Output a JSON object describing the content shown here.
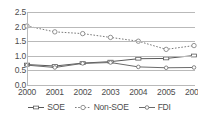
{
  "chart_data": {
    "type": "line",
    "title": "",
    "xlabel": "",
    "ylabel": "",
    "categories": [
      "2000",
      "2001",
      "2002",
      "2003",
      "2004",
      "2005",
      "2006"
    ],
    "x": [
      2000,
      2001,
      2002,
      2003,
      2004,
      2005,
      2006
    ],
    "ylim": [
      0.0,
      2.5
    ],
    "yticks": [
      "0.0",
      "0.5",
      "1.0",
      "1.5",
      "2.0",
      "2.5"
    ],
    "ytick_values": [
      0.0,
      0.5,
      1.0,
      1.5,
      2.0,
      2.5
    ],
    "grid": true,
    "legend_position": "bottom",
    "series": [
      {
        "name": "SOE",
        "values": [
          0.7,
          0.65,
          0.75,
          0.8,
          0.9,
          0.91,
          1.01
        ],
        "color": "#5a5a5a",
        "line_style": "solid",
        "marker": "dash"
      },
      {
        "name": "Non-SOE",
        "values": [
          2.02,
          1.82,
          1.76,
          1.63,
          1.5,
          1.22,
          1.35
        ],
        "color": "#7a7a7a",
        "line_style": "dotted",
        "marker": "circle"
      },
      {
        "name": "FDI",
        "values": [
          0.68,
          0.6,
          0.74,
          0.77,
          0.62,
          0.59,
          0.6
        ],
        "color": "#6b6b6b",
        "line_style": "solid",
        "marker": "circle-small"
      }
    ]
  },
  "colors": {
    "grid": "#b9b9b9",
    "text": "#4d4d4d",
    "background": "#ffffff"
  }
}
